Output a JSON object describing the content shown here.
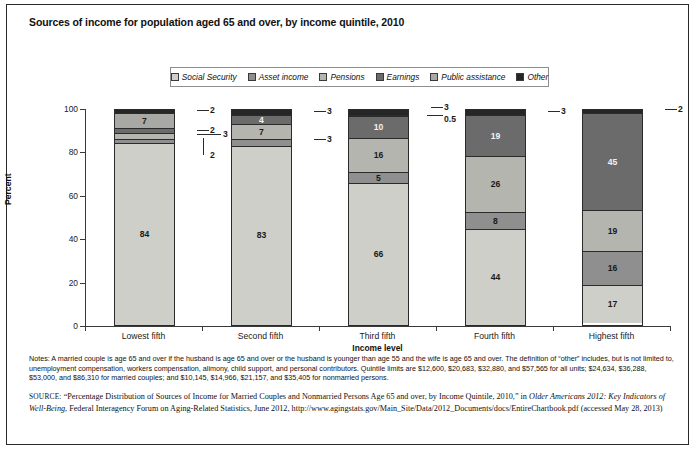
{
  "title": "Sources of income for population aged 65 and over, by income quintile, 2010",
  "legend": {
    "items": [
      {
        "label": "Social Security",
        "color": "#cfcfc9"
      },
      {
        "label": "Asset income",
        "color": "#8f8f8f"
      },
      {
        "label": "Pensions",
        "color": "#b5b5b0"
      },
      {
        "label": "Earnings",
        "color": "#6b6b6b"
      },
      {
        "label": "Public assistance",
        "color": "#a8a8a4"
      },
      {
        "label": "Other",
        "color": "#262626"
      }
    ]
  },
  "axes": {
    "y_title": "Percent",
    "x_title": "Income level",
    "y_ticks": [
      "0",
      "20",
      "40",
      "60",
      "80",
      "100"
    ],
    "x_ticks": [
      "Lowest fifth",
      "Second fifth",
      "Third fifth",
      "Fourth fifth",
      "Highest fifth"
    ]
  },
  "chart_data": {
    "type": "bar",
    "subtype": "stacked-100-percent",
    "title": "Sources of income for population aged 65 and over, by income quintile, 2010",
    "xlabel": "Income level",
    "ylabel": "Percent",
    "ylim": [
      0,
      100
    ],
    "y_ticks": [
      0,
      20,
      40,
      60,
      80,
      100
    ],
    "grid": false,
    "legend_position": "top-center",
    "categories": [
      "Lowest fifth",
      "Second fifth",
      "Third fifth",
      "Fourth fifth",
      "Highest fifth"
    ],
    "series": [
      {
        "name": "Social Security",
        "color": "#cfcfc9",
        "values": [
          84,
          83,
          66,
          44,
          17
        ]
      },
      {
        "name": "Asset income",
        "color": "#8f8f8f",
        "values": [
          2,
          3,
          5,
          8,
          16
        ]
      },
      {
        "name": "Pensions",
        "color": "#b5b5b0",
        "values": [
          3,
          7,
          16,
          26,
          19
        ]
      },
      {
        "name": "Earnings",
        "color": "#6b6b6b",
        "values": [
          2,
          4,
          10,
          19,
          45
        ]
      },
      {
        "name": "Public assistance",
        "color": "#a8a8a4",
        "values": [
          7,
          0,
          0.5,
          0,
          0
        ]
      },
      {
        "name": "Other",
        "color": "#262626",
        "values": [
          2,
          3,
          3,
          3,
          2
        ]
      }
    ],
    "annotations": [
      {
        "category": "Lowest fifth",
        "series": "Other",
        "value": 2,
        "leader": true
      },
      {
        "category": "Lowest fifth",
        "series": "Earnings",
        "value": 2,
        "leader": true
      },
      {
        "category": "Lowest fifth",
        "series": "Pensions",
        "value": 3,
        "leader": true
      },
      {
        "category": "Lowest fifth",
        "series": "Asset income",
        "value": 2,
        "leader": true
      },
      {
        "category": "Second fifth",
        "series": "Other",
        "value": 3,
        "leader": true
      },
      {
        "category": "Second fifth",
        "series": "Asset income",
        "value": 3,
        "leader": true
      },
      {
        "category": "Third fifth",
        "series": "Other",
        "value": 3,
        "leader": true
      },
      {
        "category": "Third fifth",
        "series": "Public assistance",
        "value": 0.5,
        "leader": true
      },
      {
        "category": "Fourth fifth",
        "series": "Other",
        "value": 3,
        "leader": true
      },
      {
        "category": "Highest fifth",
        "series": "Other",
        "value": 2,
        "leader": true
      }
    ]
  },
  "bars": [
    {
      "category": "Lowest fifth",
      "segments": [
        {
          "series": "Other",
          "value": 2,
          "label": "2",
          "show_inside": false,
          "color": "#262626"
        },
        {
          "series": "Public assistance",
          "value": 7,
          "label": "7",
          "show_inside": true,
          "color": "#a8a8a4"
        },
        {
          "series": "Earnings",
          "value": 2,
          "label": "2",
          "show_inside": false,
          "color": "#6b6b6b"
        },
        {
          "series": "Pensions",
          "value": 3,
          "label": "3",
          "show_inside": false,
          "color": "#b5b5b0"
        },
        {
          "series": "Asset income",
          "value": 2,
          "label": "2",
          "show_inside": false,
          "color": "#8f8f8f"
        },
        {
          "series": "Social Security",
          "value": 84,
          "label": "84",
          "show_inside": true,
          "color": "#cfcfc9"
        }
      ]
    },
    {
      "category": "Second fifth",
      "segments": [
        {
          "series": "Other",
          "value": 3,
          "label": "3",
          "show_inside": false,
          "color": "#262626"
        },
        {
          "series": "Earnings",
          "value": 4,
          "label": "4",
          "show_inside": true,
          "color": "#6b6b6b"
        },
        {
          "series": "Pensions",
          "value": 7,
          "label": "7",
          "show_inside": true,
          "color": "#b5b5b0"
        },
        {
          "series": "Asset income",
          "value": 3,
          "label": "3",
          "show_inside": false,
          "color": "#8f8f8f"
        },
        {
          "series": "Social Security",
          "value": 83,
          "label": "83",
          "show_inside": true,
          "color": "#cfcfc9"
        }
      ]
    },
    {
      "category": "Third fifth",
      "segments": [
        {
          "series": "Other",
          "value": 3,
          "label": "3",
          "show_inside": false,
          "color": "#262626"
        },
        {
          "series": "Public assistance",
          "value": 0.5,
          "label": "0.5",
          "show_inside": false,
          "color": "#a8a8a4"
        },
        {
          "series": "Earnings",
          "value": 10,
          "label": "10",
          "show_inside": true,
          "color": "#6b6b6b"
        },
        {
          "series": "Pensions",
          "value": 16,
          "label": "16",
          "show_inside": true,
          "color": "#b5b5b0"
        },
        {
          "series": "Asset income",
          "value": 5,
          "label": "5",
          "show_inside": true,
          "color": "#8f8f8f"
        },
        {
          "series": "Social Security",
          "value": 66,
          "label": "66",
          "show_inside": true,
          "color": "#cfcfc9"
        }
      ]
    },
    {
      "category": "Fourth fifth",
      "segments": [
        {
          "series": "Other",
          "value": 3,
          "label": "3",
          "show_inside": false,
          "color": "#262626"
        },
        {
          "series": "Earnings",
          "value": 19,
          "label": "19",
          "show_inside": true,
          "color": "#6b6b6b"
        },
        {
          "series": "Pensions",
          "value": 26,
          "label": "26",
          "show_inside": true,
          "color": "#b5b5b0"
        },
        {
          "series": "Asset income",
          "value": 8,
          "label": "8",
          "show_inside": true,
          "color": "#8f8f8f"
        },
        {
          "series": "Social Security",
          "value": 44,
          "label": "44",
          "show_inside": true,
          "color": "#cfcfc9"
        }
      ]
    },
    {
      "category": "Highest fifth",
      "segments": [
        {
          "series": "Other",
          "value": 2,
          "label": "2",
          "show_inside": false,
          "color": "#262626"
        },
        {
          "series": "Earnings",
          "value": 45,
          "label": "45",
          "show_inside": true,
          "color": "#6b6b6b"
        },
        {
          "series": "Pensions",
          "value": 19,
          "label": "19",
          "show_inside": true,
          "color": "#b5b5b0"
        },
        {
          "series": "Asset income",
          "value": 16,
          "label": "16",
          "show_inside": true,
          "color": "#8f8f8f"
        },
        {
          "series": "Social Security",
          "value": 17,
          "label": "17",
          "show_inside": true,
          "color": "#cfcfc9"
        }
      ]
    }
  ],
  "callouts": [
    {
      "text": "2",
      "left": 203,
      "top": 101
    },
    {
      "text": "2",
      "left": 203,
      "top": 121
    },
    {
      "text": "3",
      "left": 216,
      "top": 125
    },
    {
      "text": "2",
      "left": 203,
      "top": 146
    },
    {
      "text": "3",
      "left": 320,
      "top": 102
    },
    {
      "text": "3",
      "left": 320,
      "top": 130
    },
    {
      "text": "3",
      "left": 437,
      "top": 98
    },
    {
      "text": "0.5",
      "left": 437,
      "top": 110
    },
    {
      "text": "3",
      "left": 554,
      "top": 102
    },
    {
      "text": "2",
      "left": 671,
      "top": 100
    }
  ],
  "notes": {
    "text": "Notes: A married couple is age 65 and over if the husband is age 65 and over or the husband is younger than age 55 and the wife is age 65 and over. The definition of  “other” includes, but is not limited to, unemployment compensation, workers compensation, alimony, child support, and personal contributors. Quintile limits are $12,600, $20,683, $32,880, and $57,565 for all units; $24,634, $36,288, $53,000, and $86,310 for married couples; and $10,145, $14,966, $21,157, and $35,405 for nonmarried persons."
  },
  "source": {
    "tag": "SOURCE:",
    "part1": " “Percentage Distribution of Sources of Income for Married Couples and Nonmarried Persons Age 65 and over, by Income Quintile, 2010,” in ",
    "italic": "Older Americans 2012: Key Indicators of Well-Being",
    "part2": ", Federal Interagency Forum on Aging-Related Statistics, June 2012, http://www.agingstats.gov/Main_Site/Data/2012_Documents/docs/EntireChartbook.pdf (accessed May 28, 2013)"
  }
}
